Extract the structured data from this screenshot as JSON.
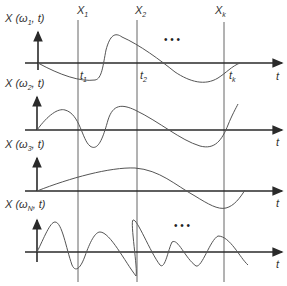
{
  "figure": {
    "vertical_lines": [
      {
        "label": "X",
        "sub": "1",
        "x": 78
      },
      {
        "label": "X",
        "sub": "2",
        "x": 137
      },
      {
        "label": "X",
        "sub": "k",
        "x": 224
      }
    ],
    "panels": [
      {
        "ylabel": "X (ω",
        "ylabel_sub": "1",
        "ylabel_tail": ", t)",
        "xlabel": "t",
        "time_marks": [
          {
            "label": "t",
            "sub": "1"
          },
          {
            "label": "t",
            "sub": "2"
          },
          {
            "label": "t",
            "sub": "k"
          }
        ],
        "ellipsis": "• • •"
      },
      {
        "ylabel": "X (ω",
        "ylabel_sub": "2",
        "ylabel_tail": ", t)",
        "xlabel": "t"
      },
      {
        "ylabel": "X (ω",
        "ylabel_sub": "3",
        "ylabel_tail": ", t)",
        "xlabel": "t"
      },
      {
        "ylabel": "X (ω",
        "ylabel_sub": "N",
        "ylabel_tail": ", t)",
        "xlabel": "t",
        "ellipsis": "• • •"
      }
    ]
  }
}
